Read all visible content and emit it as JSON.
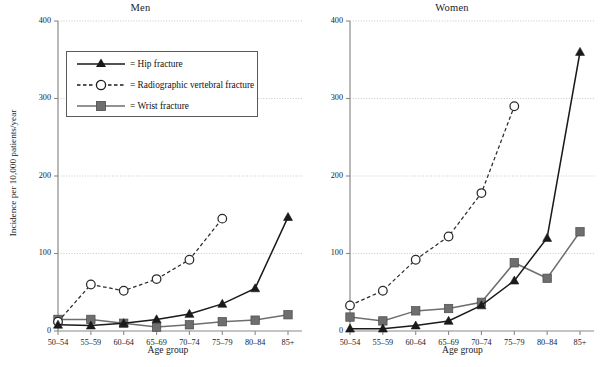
{
  "figure": {
    "ylabel": "Incidence per 10,000 patients/year",
    "xlabel_men": "Age group",
    "xlabel_women": "Age group",
    "categories": [
      "50–54",
      "55–59",
      "60–64",
      "65–69",
      "70–74",
      "75–79",
      "80–84",
      "85+"
    ],
    "yticks": [
      "0",
      "100",
      "200",
      "300",
      "400"
    ]
  },
  "legend": {
    "items": [
      {
        "label": "= Hip fracture",
        "icon": "triangle-solid-marker",
        "style": "solid"
      },
      {
        "label": "= Radiographic vertebral fracture",
        "icon": "circle-open-marker",
        "style": "dashed"
      },
      {
        "label": "= Wrist fracture",
        "icon": "square-solid-marker",
        "style": "solid"
      }
    ]
  },
  "colors": {
    "hip": "#1a1a1a",
    "vertebral": "#2b2b2b",
    "wrist": "#6e6e6e",
    "axis": "#8a8a8a",
    "grid": "#b9b9b9"
  },
  "chart_data": [
    {
      "type": "line",
      "title": "Men",
      "xlabel": "Age group",
      "ylabel": "Incidence per 10,000 patients/year",
      "categories": [
        "50–54",
        "55–59",
        "60–64",
        "65–69",
        "70–74",
        "75–79",
        "80–84",
        "85+"
      ],
      "ylim": [
        0,
        400
      ],
      "yticks": [
        0,
        100,
        200,
        300,
        400
      ],
      "grid": true,
      "legend_position": "upper-left-inside",
      "series": [
        {
          "name": "Hip fracture",
          "marker": "triangle",
          "line": "solid",
          "values": [
            8,
            7,
            10,
            15,
            22,
            35,
            55,
            147
          ]
        },
        {
          "name": "Radiographic vertebral fracture",
          "marker": "open-circle",
          "line": "dashed",
          "values": [
            12,
            60,
            52,
            67,
            92,
            145,
            null,
            null
          ]
        },
        {
          "name": "Wrist fracture",
          "marker": "square",
          "line": "solid",
          "values": [
            15,
            15,
            10,
            5,
            8,
            12,
            14,
            21
          ]
        }
      ]
    },
    {
      "type": "line",
      "title": "Women",
      "xlabel": "Age group",
      "ylabel": "Incidence per 10,000 patients/year",
      "categories": [
        "50–54",
        "55–59",
        "60–64",
        "65–69",
        "70–74",
        "75–79",
        "80–84",
        "85+"
      ],
      "ylim": [
        0,
        400
      ],
      "yticks": [
        0,
        100,
        200,
        300,
        400
      ],
      "grid": true,
      "legend_position": "none",
      "series": [
        {
          "name": "Hip fracture",
          "marker": "triangle",
          "line": "solid",
          "values": [
            3,
            3,
            7,
            13,
            33,
            65,
            120,
            360
          ]
        },
        {
          "name": "Radiographic vertebral fracture",
          "marker": "open-circle",
          "line": "dashed",
          "values": [
            33,
            52,
            92,
            122,
            178,
            290,
            null,
            null
          ]
        },
        {
          "name": "Wrist fracture",
          "marker": "square",
          "line": "solid",
          "values": [
            18,
            13,
            26,
            29,
            37,
            88,
            68,
            128
          ]
        }
      ]
    }
  ]
}
